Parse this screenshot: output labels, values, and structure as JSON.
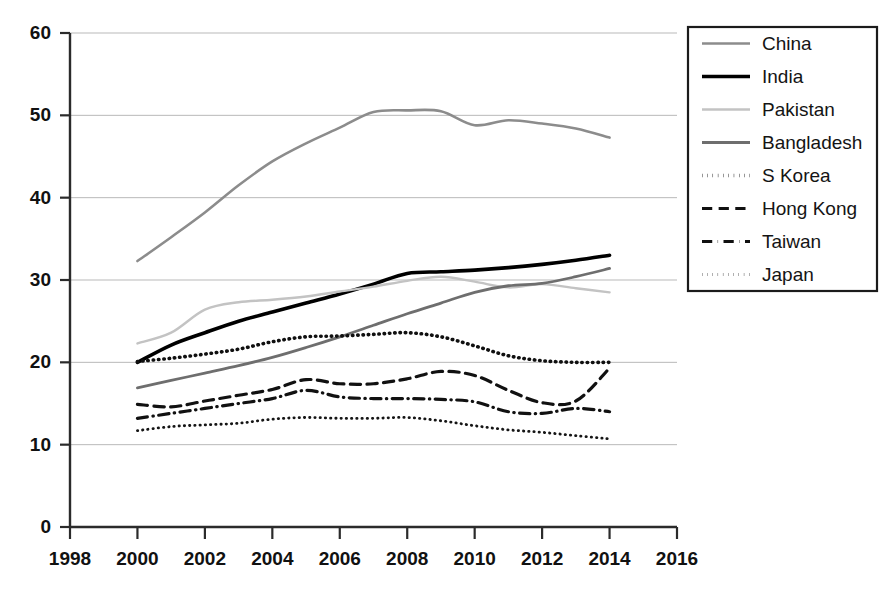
{
  "chart_data": {
    "type": "line",
    "title": "",
    "xlabel": "",
    "ylabel": "",
    "xlim": [
      1998,
      2016
    ],
    "ylim": [
      0,
      60
    ],
    "xticks": [
      1998,
      2000,
      2002,
      2004,
      2006,
      2008,
      2010,
      2012,
      2014,
      2016
    ],
    "yticks": [
      0,
      10,
      20,
      30,
      40,
      50,
      60
    ],
    "grid": "horizontal",
    "legend_position": "right",
    "x": [
      2000,
      2001,
      2002,
      2003,
      2004,
      2005,
      2006,
      2007,
      2008,
      2009,
      2010,
      2011,
      2012,
      2013,
      2014
    ],
    "series": [
      {
        "name": "China",
        "style": "solid",
        "color": "#8c8c8c",
        "width": 2.6,
        "values": [
          32.3,
          35.2,
          38.2,
          41.5,
          44.4,
          46.6,
          48.5,
          50.4,
          50.6,
          50.5,
          48.8,
          49.4,
          49.0,
          48.4,
          47.3
        ]
      },
      {
        "name": "India",
        "style": "solid",
        "color": "#000000",
        "width": 3.6,
        "values": [
          20.0,
          22.1,
          23.6,
          25.0,
          26.1,
          27.2,
          28.3,
          29.5,
          30.8,
          31.0,
          31.2,
          31.5,
          31.9,
          32.4,
          33.0
        ]
      },
      {
        "name": "Pakistan",
        "style": "solid",
        "color": "#c3c3c3",
        "width": 2.4,
        "values": [
          22.3,
          23.6,
          26.4,
          27.3,
          27.6,
          28.0,
          28.6,
          29.2,
          29.9,
          30.4,
          29.8,
          29.1,
          29.5,
          29.0,
          28.5
        ]
      },
      {
        "name": "Bangladesh",
        "style": "solid",
        "color": "#6e6e6e",
        "width": 2.8,
        "values": [
          16.9,
          17.8,
          18.7,
          19.6,
          20.6,
          21.8,
          23.1,
          24.5,
          25.9,
          27.2,
          28.5,
          29.3,
          29.6,
          30.4,
          31.4
        ]
      },
      {
        "name": "S Korea",
        "style": "dotted-thick",
        "color": "#101010",
        "width": 3.6,
        "values": [
          20.1,
          20.5,
          21.0,
          21.6,
          22.5,
          23.1,
          23.2,
          23.4,
          23.6,
          23.1,
          22.0,
          20.8,
          20.2,
          20.0,
          20.0
        ]
      },
      {
        "name": "Hong Kong",
        "style": "dashed",
        "color": "#111111",
        "width": 3.2,
        "values": [
          14.9,
          14.6,
          15.3,
          16.0,
          16.7,
          17.9,
          17.4,
          17.4,
          18.0,
          18.9,
          18.4,
          16.6,
          15.1,
          15.3,
          19.3
        ]
      },
      {
        "name": "Taiwan",
        "style": "dash-dot",
        "color": "#111111",
        "width": 3.2,
        "values": [
          13.2,
          13.8,
          14.4,
          15.0,
          15.6,
          16.6,
          15.8,
          15.6,
          15.6,
          15.5,
          15.2,
          14.0,
          13.8,
          14.4,
          14.0
        ]
      },
      {
        "name": "Japan",
        "style": "dotted-fine",
        "color": "#151515",
        "width": 2.8,
        "values": [
          11.7,
          12.2,
          12.4,
          12.6,
          13.1,
          13.3,
          13.2,
          13.2,
          13.3,
          12.9,
          12.3,
          11.8,
          11.5,
          11.1,
          10.7
        ]
      }
    ]
  },
  "legend": {
    "items": [
      {
        "label": "China"
      },
      {
        "label": "India"
      },
      {
        "label": "Pakistan"
      },
      {
        "label": "Bangladesh"
      },
      {
        "label": "S Korea"
      },
      {
        "label": "Hong Kong"
      },
      {
        "label": "Taiwan"
      },
      {
        "label": "Japan"
      }
    ]
  }
}
